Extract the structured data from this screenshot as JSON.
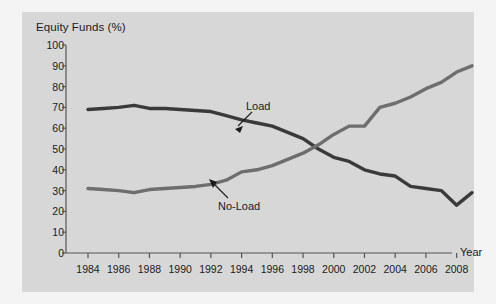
{
  "chart_data": {
    "type": "line",
    "title": "",
    "ylabel": "Equity Funds (%)",
    "xlabel": "Year",
    "ylim": [
      0,
      100
    ],
    "ytick_step": 10,
    "yticks": [
      "0",
      "10",
      "20",
      "30",
      "40",
      "50",
      "60",
      "70",
      "80",
      "90",
      "100"
    ],
    "xlim": [
      1984,
      2009
    ],
    "xticks": [
      "1984",
      "1986",
      "1988",
      "1990",
      "1992",
      "1994",
      "1996",
      "1998",
      "2000",
      "2002",
      "2004",
      "2006",
      "2008"
    ],
    "xtick_step": 2,
    "grid": false,
    "legend_position": "inline-annotations",
    "x": [
      1984,
      1985,
      1986,
      1987,
      1988,
      1989,
      1990,
      1991,
      1992,
      1993,
      1994,
      1995,
      1996,
      1997,
      1998,
      1999,
      2000,
      2001,
      2002,
      2003,
      2004,
      2005,
      2006,
      2007,
      2008,
      2009
    ],
    "series": [
      {
        "name": "Load",
        "color": "#3a3a3a",
        "values": [
          69,
          69.5,
          70,
          71,
          69.5,
          69.5,
          69,
          68.5,
          68,
          66,
          64,
          62.5,
          61,
          58,
          55,
          50,
          46,
          44,
          40,
          38,
          37,
          32,
          31,
          30,
          23,
          29
        ]
      },
      {
        "name": "No-Load",
        "color": "#6e6e6e",
        "values": [
          31,
          30.5,
          30,
          29,
          30.5,
          31,
          31.5,
          32,
          33,
          35,
          39,
          40,
          42,
          45,
          48,
          52,
          57,
          61,
          61,
          70,
          72,
          75,
          79,
          82,
          87,
          90
        ]
      }
    ],
    "annotations": [
      {
        "label": "Load",
        "target_series": "Load"
      },
      {
        "label": "No-Load",
        "target_series": "No-Load"
      }
    ]
  },
  "colors": {
    "panel_bg": "#d7d7d7",
    "page_bg": "#f4f4f4",
    "axis": "#555555",
    "text": "#1a1a1a",
    "load_line": "#3a3a3a",
    "noload_line": "#6e6e6e"
  }
}
